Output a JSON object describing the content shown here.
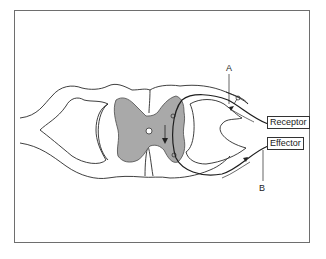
{
  "diagram": {
    "labels": {
      "a": "A",
      "b": "B",
      "receptor": "Receptor",
      "effector": "Effector"
    },
    "colors": {
      "gray_matter": "#a9a9a9",
      "outline": "#2a2a2a",
      "frame": "#6e6e6e"
    },
    "elements": [
      "spinal cord cross-section outline",
      "gray matter (butterfly shape)",
      "central canal",
      "dorsal root (sensory pathway) with ganglion",
      "ventral root (motor pathway)",
      "neuron pathway with synapses",
      "direction arrows"
    ]
  }
}
